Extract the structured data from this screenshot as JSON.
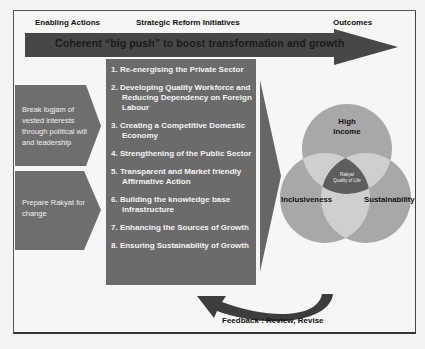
{
  "headers": {
    "enabling_actions": "Enabling Actions",
    "strategic_reform_initiatives": "Strategic Reform Initiatives",
    "outcomes": "Outcomes"
  },
  "big_push_arrow": {
    "label": "Coherent “big push” to boost transformation and growth"
  },
  "enabling_actions": [
    {
      "label": "Break logjam of vested interests through political will and leadership"
    },
    {
      "label": "Prepare Rakyat for change"
    }
  ],
  "initiatives": [
    "1. Re-energising the Private Sector",
    "2. Developing Quality Workforce and Reducing Dependency on Foreign Labour",
    "3. Creating a Competitive Domestic Economy",
    "4. Strengthening of the Public Sector",
    "5. Transparent and Market friendly Affirmative Action",
    "6. Building the knowledge base infrastructure",
    "7. Enhancing the Sources of Growth",
    "8. Ensuring Sustainability of Growth"
  ],
  "outcomes": {
    "top": "High Income",
    "left": "Inclusiveness",
    "right": "Sustainability",
    "center": "Rakyat Quality of Life"
  },
  "feedback": {
    "label": "Feedback : Review, Revise"
  },
  "colors": {
    "box_fill": "#6b6b6b",
    "arrow_fill": "#4a4a4a",
    "circle_fill": "#a9a9a9",
    "overlap_fill": "#cfcfcf",
    "center_fill": "#5c5c5c"
  }
}
